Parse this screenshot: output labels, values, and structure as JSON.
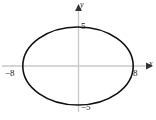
{
  "figure": {
    "kind": "coordinate-plane-ellipse-graph",
    "background": "#ffffff",
    "axis_color": "#c9c9c9",
    "arrow_color": "#333333",
    "curve_color": "#111111",
    "label_color": "#1a1a1a"
  },
  "axes": {
    "x_name": "x",
    "y_name": "y",
    "origin_px": {
      "x": 78,
      "y": 66
    },
    "x_unit_px": 6.9,
    "y_unit_px": 7.8,
    "x_range": [
      -10.0,
      10.5
    ],
    "y_range": [
      -6.5,
      7.5
    ],
    "grid": false
  },
  "ticks": {
    "x": [
      {
        "value": -8,
        "label": "−8"
      },
      {
        "value": 8,
        "label": "8"
      }
    ],
    "y": [
      {
        "value": 5,
        "label": "5"
      },
      {
        "value": -5,
        "label": "−5"
      }
    ]
  },
  "chart_data": {
    "type": "line",
    "title": "",
    "subtitle": "",
    "xlabel": "x",
    "ylabel": "y",
    "xlim": [
      -10.0,
      10.5
    ],
    "ylim": [
      -6.5,
      7.5
    ],
    "grid": false,
    "legend": null,
    "tick_labels": {
      "x": [
        "−8",
        "8"
      ],
      "y": [
        "5",
        "−5"
      ]
    },
    "series": [
      {
        "name": "ellipse",
        "shape": "ellipse",
        "equation": "x^2/64 + y^2/25 = 1",
        "center": [
          0,
          0
        ],
        "semi_axis_x": 8,
        "semi_axis_y": 5,
        "vertices": [
          [
            -8,
            0
          ],
          [
            8,
            0
          ]
        ],
        "co_vertices": [
          [
            0,
            5
          ],
          [
            0,
            -5
          ]
        ],
        "x_intercepts": [
          -8,
          8
        ],
        "y_intercepts": [
          -5,
          5
        ],
        "closed": true,
        "color": "#111111",
        "line_width": 1.6
      }
    ],
    "annotations": []
  }
}
